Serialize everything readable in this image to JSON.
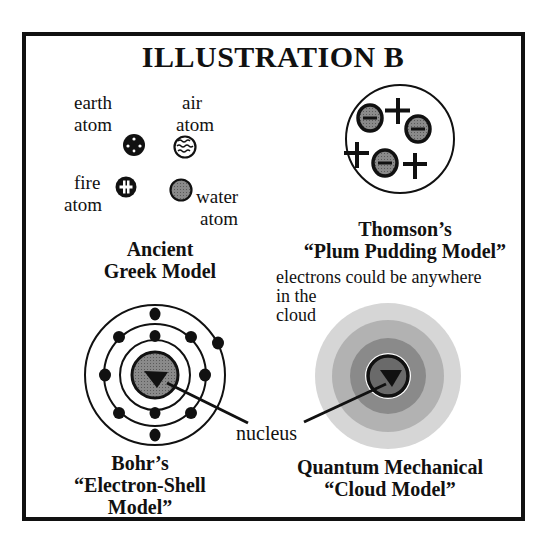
{
  "title": "ILLUSTRATION B",
  "ancient_greek": {
    "atoms": [
      {
        "label_line1": "earth",
        "label_line2": "atom",
        "icon": "earth-atom-icon"
      },
      {
        "label_line1": "air",
        "label_line2": "atom",
        "icon": "air-atom-icon"
      },
      {
        "label_line1": "fire",
        "label_line2": "atom",
        "icon": "fire-atom-icon"
      },
      {
        "label_line1": "water",
        "label_line2": "atom",
        "icon": "water-atom-icon"
      }
    ],
    "caption_line1": "Ancient",
    "caption_line2": "Greek Model"
  },
  "thomson": {
    "caption_line1": "Thomson’s",
    "caption_line2": "“Plum Pudding Model”",
    "electrons": 4,
    "positive_charges": 4
  },
  "bohr": {
    "caption_line1": "Bohr’s",
    "caption_line2": "“Electron-Shell Model”",
    "shells": 3
  },
  "quantum": {
    "annotation_line1": "electrons could be anywhere",
    "annotation_line2": "in the",
    "annotation_line3": "cloud",
    "caption_line1": "Quantum Mechanical",
    "caption_line2": "“Cloud Model”"
  },
  "pointer_label": "nucleus",
  "colors": {
    "ink": "#111111",
    "nucleus_gray": "#7a7a7a",
    "cloud_outer": "#d4d4d4",
    "cloud_mid": "#b4b4b4",
    "cloud_inner": "#8e8e8e",
    "cloud_core": "#6e6e6e"
  }
}
